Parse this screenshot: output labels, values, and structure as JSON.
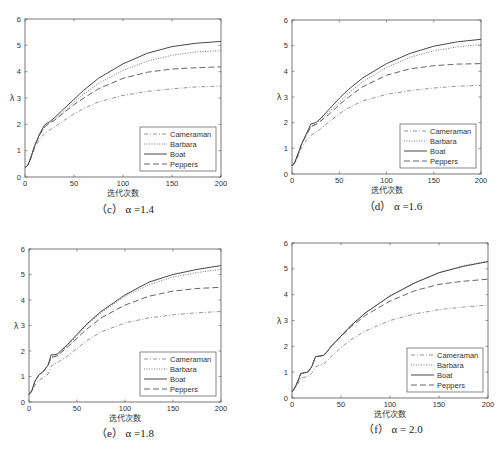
{
  "chart_data": [
    {
      "type": "line",
      "id": "c",
      "caption": "（c） α =1.4",
      "xlabel": "迭代次数",
      "ylabel": "λ",
      "xlim": [
        0,
        200
      ],
      "ylim": [
        0,
        6
      ],
      "xticks": [
        0,
        50,
        100,
        150,
        200
      ],
      "yticks": [
        0,
        1,
        2,
        3,
        4,
        5,
        6
      ],
      "legend_position": "lower-right",
      "x": [
        0,
        3,
        6,
        10,
        15,
        20,
        25,
        30,
        40,
        50,
        60,
        75,
        100,
        125,
        150,
        175,
        200
      ],
      "series": [
        {
          "name": "Cameraman",
          "style": "dashdot",
          "values": [
            0.35,
            0.45,
            0.7,
            1.1,
            1.45,
            1.65,
            1.78,
            1.9,
            2.15,
            2.4,
            2.6,
            2.85,
            3.1,
            3.25,
            3.35,
            3.42,
            3.45
          ]
        },
        {
          "name": "Barbara",
          "style": "dotted",
          "values": [
            0.35,
            0.45,
            0.75,
            1.2,
            1.6,
            1.9,
            2.05,
            2.2,
            2.5,
            2.85,
            3.15,
            3.55,
            4.05,
            4.4,
            4.62,
            4.75,
            4.8
          ]
        },
        {
          "name": "Boat",
          "style": "solid",
          "values": [
            0.35,
            0.45,
            0.75,
            1.2,
            1.65,
            1.98,
            2.1,
            2.25,
            2.6,
            2.95,
            3.3,
            3.75,
            4.3,
            4.7,
            4.95,
            5.08,
            5.15
          ]
        },
        {
          "name": "Peppers",
          "style": "dashed",
          "values": [
            0.35,
            0.45,
            0.75,
            1.2,
            1.6,
            1.9,
            2.05,
            2.15,
            2.45,
            2.75,
            3.0,
            3.35,
            3.75,
            3.98,
            4.1,
            4.15,
            4.18
          ]
        }
      ]
    },
    {
      "type": "line",
      "id": "d",
      "caption": "（d） α =1.6",
      "xlabel": "迭代次数",
      "ylabel": "λ",
      "xlim": [
        0,
        200
      ],
      "ylim": [
        0,
        6
      ],
      "xticks": [
        0,
        50,
        100,
        150,
        200
      ],
      "yticks": [
        0,
        1,
        2,
        3,
        4,
        5,
        6
      ],
      "legend_position": "lower-right",
      "x": [
        0,
        3,
        6,
        10,
        15,
        20,
        25,
        30,
        40,
        50,
        60,
        75,
        100,
        125,
        150,
        175,
        200
      ],
      "series": [
        {
          "name": "Cameraman",
          "style": "dashdot",
          "values": [
            0.32,
            0.42,
            0.65,
            1.0,
            1.3,
            1.5,
            1.62,
            1.75,
            2.05,
            2.35,
            2.58,
            2.85,
            3.1,
            3.25,
            3.35,
            3.42,
            3.45
          ]
        },
        {
          "name": "Barbara",
          "style": "dotted",
          "values": [
            0.32,
            0.45,
            0.75,
            1.15,
            1.5,
            1.85,
            1.95,
            2.1,
            2.45,
            2.8,
            3.15,
            3.6,
            4.15,
            4.55,
            4.8,
            4.95,
            5.05
          ]
        },
        {
          "name": "Boat",
          "style": "solid",
          "values": [
            0.32,
            0.45,
            0.75,
            1.15,
            1.55,
            1.95,
            2.0,
            2.15,
            2.55,
            2.95,
            3.3,
            3.75,
            4.3,
            4.7,
            4.98,
            5.15,
            5.25
          ]
        },
        {
          "name": "Peppers",
          "style": "dashed",
          "values": [
            0.32,
            0.45,
            0.75,
            1.15,
            1.5,
            1.85,
            1.92,
            2.05,
            2.35,
            2.7,
            3.0,
            3.4,
            3.85,
            4.1,
            4.22,
            4.28,
            4.3
          ]
        }
      ]
    },
    {
      "type": "line",
      "id": "e",
      "caption": "（e） α =1.8",
      "xlabel": "迭代次数",
      "ylabel": "λ",
      "xlim": [
        0,
        200
      ],
      "ylim": [
        0,
        6
      ],
      "xticks": [
        0,
        50,
        100,
        150,
        200
      ],
      "yticks": [
        0,
        1,
        2,
        3,
        4,
        5,
        6
      ],
      "legend_position": "lower-right",
      "x": [
        0,
        3,
        6,
        10,
        15,
        20,
        23,
        27,
        30,
        40,
        50,
        60,
        75,
        100,
        125,
        150,
        175,
        200
      ],
      "series": [
        {
          "name": "Cameraman",
          "style": "dashdot",
          "values": [
            0.3,
            0.4,
            0.65,
            0.85,
            0.95,
            1.1,
            1.4,
            1.5,
            1.55,
            1.8,
            2.1,
            2.4,
            2.75,
            3.1,
            3.3,
            3.42,
            3.5,
            3.55
          ]
        },
        {
          "name": "Barbara",
          "style": "dotted",
          "values": [
            0.3,
            0.45,
            0.8,
            1.05,
            1.2,
            1.45,
            1.75,
            1.8,
            1.85,
            2.2,
            2.6,
            3.0,
            3.5,
            4.15,
            4.6,
            4.9,
            5.08,
            5.2
          ]
        },
        {
          "name": "Boat",
          "style": "solid",
          "values": [
            0.3,
            0.45,
            0.8,
            1.05,
            1.2,
            1.45,
            1.85,
            1.85,
            1.9,
            2.25,
            2.65,
            3.05,
            3.55,
            4.2,
            4.7,
            5.0,
            5.2,
            5.35
          ]
        },
        {
          "name": "Peppers",
          "style": "dashed",
          "values": [
            0.3,
            0.45,
            0.8,
            1.05,
            1.2,
            1.45,
            1.75,
            1.78,
            1.82,
            2.15,
            2.5,
            2.85,
            3.3,
            3.8,
            4.15,
            4.35,
            4.45,
            4.5
          ]
        }
      ]
    },
    {
      "type": "line",
      "id": "f",
      "caption": "（f） α = 2.0",
      "xlabel": "迭代次数",
      "ylabel": "λ",
      "xlim": [
        0,
        200
      ],
      "ylim": [
        0,
        6
      ],
      "xticks": [
        0,
        50,
        100,
        150,
        200
      ],
      "yticks": [
        0,
        1,
        2,
        3,
        4,
        5,
        6
      ],
      "legend_position": "lower-right",
      "x": [
        0,
        3,
        6,
        9,
        12,
        16,
        20,
        24,
        28,
        32,
        36,
        40,
        50,
        60,
        75,
        100,
        125,
        150,
        175,
        200
      ],
      "series": [
        {
          "name": "Cameraman",
          "style": "dashdot",
          "values": [
            0.25,
            0.35,
            0.55,
            0.78,
            0.8,
            0.82,
            0.95,
            1.2,
            1.28,
            1.3,
            1.45,
            1.6,
            1.95,
            2.25,
            2.6,
            3.0,
            3.25,
            3.42,
            3.52,
            3.6
          ]
        },
        {
          "name": "Barbara",
          "style": "dotted",
          "values": [
            0.25,
            0.4,
            0.65,
            0.95,
            0.97,
            1.0,
            1.2,
            1.6,
            1.62,
            1.65,
            1.8,
            2.0,
            2.4,
            2.8,
            3.3,
            3.95,
            4.45,
            4.85,
            5.12,
            5.3
          ]
        },
        {
          "name": "Boat",
          "style": "solid",
          "values": [
            0.25,
            0.4,
            0.65,
            0.95,
            0.97,
            1.0,
            1.2,
            1.6,
            1.62,
            1.65,
            1.8,
            2.0,
            2.4,
            2.8,
            3.3,
            3.95,
            4.45,
            4.85,
            5.1,
            5.28
          ]
        },
        {
          "name": "Peppers",
          "style": "dashed",
          "values": [
            0.25,
            0.4,
            0.65,
            0.95,
            0.97,
            1.0,
            1.2,
            1.6,
            1.62,
            1.65,
            1.8,
            2.0,
            2.38,
            2.75,
            3.2,
            3.75,
            4.15,
            4.4,
            4.52,
            4.6
          ]
        }
      ]
    }
  ]
}
